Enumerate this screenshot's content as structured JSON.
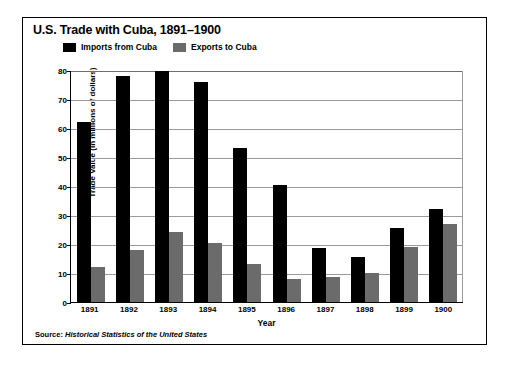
{
  "chart_data": {
    "type": "bar",
    "title": "U.S. Trade with Cuba, 1891–1900",
    "xlabel": "Year",
    "ylabel": "Trade Value (in millions of dollars)",
    "categories": [
      "1891",
      "1892",
      "1893",
      "1894",
      "1895",
      "1896",
      "1897",
      "1898",
      "1899",
      "1900"
    ],
    "series": [
      {
        "name": "Imports from Cuba",
        "color": "#000000",
        "values": [
          62,
          78,
          79.5,
          76,
          53,
          40.5,
          18.5,
          15.5,
          25.5,
          32
        ]
      },
      {
        "name": "Exports to Cuba",
        "color": "#6b6b6b",
        "values": [
          12,
          18,
          24,
          20.5,
          13,
          8,
          8.5,
          10,
          19,
          27
        ]
      }
    ],
    "ylim": [
      0,
      80
    ],
    "yticks": [
      0,
      10,
      20,
      30,
      40,
      50,
      60,
      70,
      80
    ],
    "grid": true,
    "legend_position": "top"
  },
  "source": {
    "prefix": "Source: ",
    "text": "Historical Statistics of the United States"
  }
}
